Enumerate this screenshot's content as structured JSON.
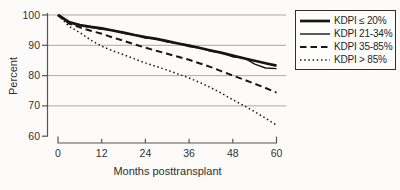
{
  "figure": {
    "y_axis_title": "Percent",
    "x_axis_title": "Months posttransplant"
  },
  "legend": {
    "items": [
      {
        "label": "KDPI ≤ 20%",
        "line_style": "thick-solid"
      },
      {
        "label": "KDPI 21-34%",
        "line_style": "thin-solid"
      },
      {
        "label": "KDPI 35-85%",
        "line_style": "dashed"
      },
      {
        "label": "KDPI > 85%",
        "line_style": "dotted"
      }
    ]
  },
  "colors": {
    "curve": "#161616",
    "grid": "#a9a9a9",
    "axis": "#565656",
    "text": "#333333",
    "background": "#fcfbf9",
    "legend_background": "#fdfdfc",
    "legend_border": "#2f2f2f"
  },
  "chart_data": {
    "type": "line",
    "title": "",
    "xlabel": "Months posttransplant",
    "ylabel": "Percent",
    "xlim": [
      0,
      60
    ],
    "ylim": [
      60,
      100
    ],
    "xticks": [
      0,
      12,
      24,
      36,
      48,
      60
    ],
    "yticks": [
      100,
      90,
      80,
      70,
      60
    ],
    "gridlines_y": [
      100,
      90,
      80,
      70
    ],
    "grid": "horizontal-only",
    "legend_position": "top-right",
    "x": [
      0,
      3,
      6,
      9,
      12,
      15,
      18,
      21,
      24,
      27,
      30,
      33,
      36,
      39,
      42,
      45,
      48,
      51,
      54,
      57,
      60
    ],
    "series": [
      {
        "id": "kdpi-le-20",
        "name": "KDPI ≤ 20%",
        "line_style": "thick-solid",
        "values": [
          100,
          97.7,
          96.7,
          96.1,
          95.6,
          94.9,
          94.2,
          93.4,
          92.7,
          92.1,
          91.4,
          90.6,
          89.9,
          89.1,
          88.3,
          87.5,
          86.6,
          85.7,
          84.9,
          84.1,
          83.3
        ]
      },
      {
        "id": "kdpi-21-34",
        "name": "KDPI 21-34%",
        "line_style": "thin-solid",
        "values": [
          100,
          97.4,
          96.4,
          95.9,
          95.3,
          95.0,
          94.0,
          93.5,
          92.4,
          92.2,
          91.1,
          90.7,
          89.6,
          89.2,
          88.0,
          87.6,
          86.2,
          85.9,
          83.8,
          82.5,
          82.3
        ]
      },
      {
        "id": "kdpi-35-85",
        "name": "KDPI 35-85%",
        "line_style": "dashed",
        "values": [
          100,
          97.2,
          95.9,
          94.8,
          93.8,
          92.6,
          91.5,
          90.3,
          89.2,
          88.2,
          87.2,
          86.2,
          85.2,
          84.0,
          82.8,
          81.4,
          80.0,
          78.7,
          77.3,
          75.9,
          74.4
        ]
      },
      {
        "id": "kdpi-gt-85",
        "name": "KDPI > 85%",
        "line_style": "dotted",
        "values": [
          100,
          96.3,
          94.2,
          91.7,
          89.7,
          88.2,
          86.9,
          85.5,
          84.2,
          83.0,
          81.8,
          80.5,
          79.2,
          77.7,
          76.0,
          74.1,
          72.0,
          70.1,
          68.1,
          65.9,
          63.7
        ]
      }
    ]
  }
}
